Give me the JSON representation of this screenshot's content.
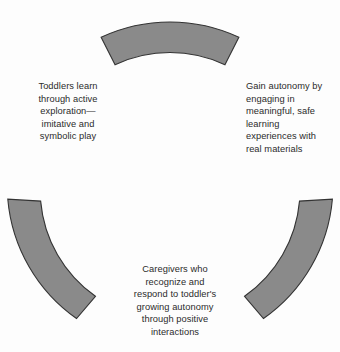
{
  "diagram": {
    "type": "broken-circle-cycle",
    "background_color": "#fdfdfd",
    "segment_fill": "#8a8a8a",
    "segment_stroke": "#333333",
    "text_color": "#2b2b2b",
    "geometry": {
      "center_x": 170,
      "center_y": 185,
      "outer_radius": 163,
      "inner_radius": 130,
      "segment_count": 3
    },
    "segments": [
      {
        "id": "segment-top",
        "position": "top",
        "start_angle_deg": -115,
        "end_angle_deg": -65
      },
      {
        "id": "segment-left",
        "position": "lower-left",
        "start_angle_deg": 125,
        "end_angle_deg": 175
      },
      {
        "id": "segment-right",
        "position": "lower-right",
        "start_angle_deg": 5,
        "end_angle_deg": 55
      }
    ],
    "labels": {
      "left": "Toddlers learn\nthrough active\nexploration—\nimitative and\nsymbolic play",
      "right": "Gain autonomy by\nengaging in\nmeaningful, safe\nlearning\nexperiences with\nreal materials",
      "bottom": "Caregivers who\nrecognize and\nrespond to toddler's\ngrowing autonomy\nthrough positive\ninteractions"
    }
  }
}
